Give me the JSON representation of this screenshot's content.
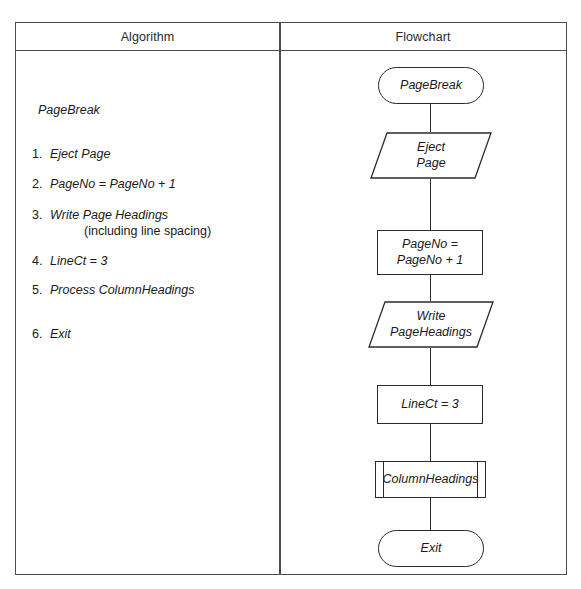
{
  "table": {
    "headers": {
      "algorithm": "Algorithm",
      "flowchart": "Flowchart"
    }
  },
  "algorithm": {
    "title": "PageBreak",
    "steps": [
      {
        "num": "1.",
        "text": "Eject Page",
        "sub": ""
      },
      {
        "num": "2.",
        "text": "PageNo = PageNo + 1",
        "sub": ""
      },
      {
        "num": "3.",
        "text": "Write Page Headings",
        "sub": "(including line spacing)"
      },
      {
        "num": "4.",
        "text": "LineCt = 3",
        "sub": ""
      },
      {
        "num": "5.",
        "text": "Process ColumnHeadings",
        "sub": ""
      },
      {
        "num": "6.",
        "text": "Exit",
        "sub": ""
      }
    ]
  },
  "flowchart": {
    "nodes": [
      {
        "id": "start",
        "shape": "terminator",
        "label": "PageBreak"
      },
      {
        "id": "eject-page",
        "shape": "io",
        "label_line1": "Eject",
        "label_line2": "Page"
      },
      {
        "id": "increment-pageno",
        "shape": "process",
        "label_line1": "PageNo =",
        "label_line2": "PageNo + 1"
      },
      {
        "id": "write-headings",
        "shape": "io",
        "label_line1": "Write",
        "label_line2": "PageHeadings"
      },
      {
        "id": "set-linect",
        "shape": "process",
        "label": "LineCt = 3"
      },
      {
        "id": "column-headings",
        "shape": "predefined",
        "label": "ColumnHeadings"
      },
      {
        "id": "exit",
        "shape": "terminator",
        "label": "Exit"
      }
    ]
  },
  "colors": {
    "border": "#4d4d4d",
    "shape_stroke": "#2b2b2b",
    "text": "#1a1a1a",
    "background": "#ffffff"
  }
}
